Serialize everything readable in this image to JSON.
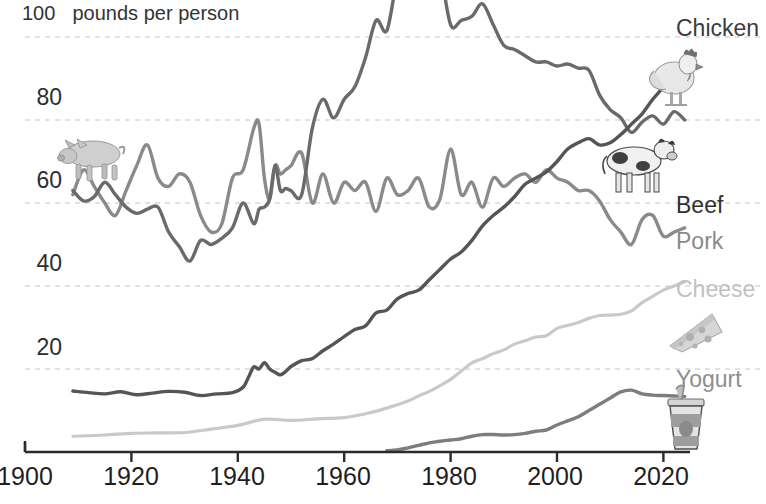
{
  "chart_data": {
    "type": "line",
    "title": "",
    "subtitle": "",
    "xlabel": "",
    "ylabel": "100  pounds per person",
    "axis_note": "100  pounds per person",
    "grid": true,
    "grid_style": "dashed horizontal",
    "legend_position": "right-inline-labels",
    "xlim": [
      1900,
      2025
    ],
    "ylim": [
      0,
      104
    ],
    "xticks": [
      "1900",
      "1920",
      "1940",
      "1960",
      "1980",
      "2000",
      "2020"
    ],
    "xtick_values": [
      1900,
      1920,
      1940,
      1960,
      1980,
      2000,
      2020
    ],
    "yticks": [
      "20",
      "40",
      "60",
      "80",
      "100"
    ],
    "ytick_values": [
      20,
      40,
      60,
      80,
      100
    ],
    "units": "pounds per person",
    "series": [
      {
        "name": "Chicken",
        "label": "Chicken",
        "color": "#555555",
        "emblem": "chicken-illustration",
        "x": [
          1909,
          1912,
          1915,
          1918,
          1921,
          1924,
          1927,
          1930,
          1933,
          1936,
          1939,
          1941,
          1942,
          1943,
          1944,
          1945,
          1946,
          1947,
          1948,
          1949,
          1950,
          1952,
          1954,
          1956,
          1958,
          1960,
          1962,
          1964,
          1966,
          1968,
          1970,
          1972,
          1974,
          1976,
          1978,
          1980,
          1982,
          1984,
          1986,
          1988,
          1990,
          1992,
          1994,
          1996,
          1998,
          2000,
          2002,
          2004,
          2006,
          2008,
          2010,
          2012,
          2014,
          2016,
          2018,
          2020,
          2022,
          2024
        ],
        "y": [
          14.7,
          14.3,
          14.0,
          14.5,
          13.8,
          14.2,
          14.6,
          14.4,
          13.6,
          14.0,
          14.3,
          15.6,
          18.0,
          20.5,
          20.0,
          21.5,
          20.0,
          19.2,
          18.6,
          19.4,
          20.6,
          22.0,
          22.5,
          24.4,
          26.0,
          27.8,
          29.5,
          30.4,
          33.5,
          34.2,
          36.9,
          38.2,
          39.0,
          41.5,
          44.0,
          46.5,
          48.2,
          51.0,
          54.5,
          57.0,
          59.0,
          61.5,
          64.5,
          66.0,
          67.5,
          70.0,
          73.0,
          74.5,
          75.5,
          74.0,
          74.5,
          76.5,
          79.0,
          81.5,
          85.0,
          88.0,
          92.0,
          94.5
        ]
      },
      {
        "name": "Beef",
        "label": "Beef",
        "color": "#6a6a6a",
        "emblem": "cow-illustration",
        "x": [
          1909,
          1911,
          1913,
          1915,
          1917,
          1919,
          1921,
          1923,
          1925,
          1927,
          1929,
          1931,
          1933,
          1935,
          1937,
          1939,
          1941,
          1943,
          1944,
          1945,
          1946,
          1947,
          1948,
          1949,
          1950,
          1952,
          1954,
          1956,
          1958,
          1960,
          1962,
          1964,
          1966,
          1968,
          1970,
          1972,
          1974,
          1976,
          1978,
          1980,
          1982,
          1984,
          1986,
          1988,
          1990,
          1992,
          1994,
          1996,
          1998,
          2000,
          2002,
          2004,
          2006,
          2008,
          2010,
          2012,
          2014,
          2016,
          2018,
          2020,
          2022,
          2024
        ],
        "y": [
          63.0,
          60.5,
          61.5,
          65.0,
          62.0,
          59.0,
          57.5,
          58.5,
          59.0,
          53.0,
          49.5,
          46.0,
          51.0,
          50.0,
          51.5,
          54.0,
          60.0,
          55.0,
          58.5,
          59.0,
          61.0,
          69.0,
          63.0,
          63.5,
          63.0,
          62.0,
          78.0,
          85.0,
          80.5,
          85.0,
          88.0,
          95.0,
          104.0,
          101.5,
          113.7,
          116.0,
          116.8,
          129.0,
          117.0,
          103.0,
          104.0,
          105.0,
          108.0,
          103.0,
          98.0,
          97.0,
          95.5,
          94.0,
          94.0,
          93.0,
          93.5,
          92.5,
          92.0,
          86.0,
          82.5,
          80.5,
          77.0,
          79.5,
          81.0,
          79.0,
          82.0,
          80.0
        ]
      },
      {
        "name": "Pork",
        "label": "Pork",
        "color": "#8a8a8a",
        "emblem": "pig-illustration",
        "x": [
          1909,
          1911,
          1913,
          1915,
          1917,
          1919,
          1921,
          1923,
          1925,
          1927,
          1929,
          1931,
          1933,
          1935,
          1937,
          1939,
          1941,
          1943,
          1944,
          1945,
          1946,
          1947,
          1948,
          1949,
          1950,
          1952,
          1954,
          1956,
          1958,
          1960,
          1962,
          1964,
          1966,
          1968,
          1970,
          1972,
          1974,
          1976,
          1978,
          1980,
          1982,
          1984,
          1986,
          1988,
          1990,
          1992,
          1994,
          1996,
          1998,
          2000,
          2002,
          2004,
          2006,
          2008,
          2010,
          2012,
          2014,
          2016,
          2018,
          2020,
          2022,
          2024
        ],
        "y": [
          62.0,
          68.0,
          64.0,
          60.0,
          57.0,
          63.0,
          69.0,
          74.0,
          66.0,
          64.0,
          67.0,
          65.0,
          57.0,
          53.0,
          55.0,
          66.0,
          68.0,
          78.0,
          79.0,
          66.0,
          61.0,
          69.0,
          67.0,
          68.0,
          69.0,
          72.0,
          60.0,
          67.0,
          60.0,
          65.0,
          63.0,
          65.0,
          58.0,
          66.0,
          62.0,
          63.0,
          66.0,
          59.0,
          61.0,
          73.0,
          62.0,
          65.0,
          59.0,
          66.0,
          64.0,
          66.0,
          67.0,
          65.0,
          68.0,
          66.0,
          65.0,
          63.0,
          63.0,
          60.5,
          56.0,
          53.0,
          50.0,
          56.0,
          57.0,
          52.0,
          53.0,
          54.0
        ]
      },
      {
        "name": "Cheese",
        "label": "Cheese",
        "color": "#c9c9c9",
        "emblem": "cheese-wedge-illustration",
        "x": [
          1909,
          1915,
          1920,
          1925,
          1930,
          1935,
          1940,
          1945,
          1950,
          1955,
          1960,
          1965,
          1970,
          1972,
          1974,
          1976,
          1978,
          1980,
          1982,
          1984,
          1986,
          1988,
          1990,
          1992,
          1994,
          1996,
          1998,
          2000,
          2002,
          2004,
          2006,
          2008,
          2010,
          2012,
          2014,
          2016,
          2018,
          2020,
          2022,
          2024
        ],
        "y": [
          3.8,
          4.1,
          4.5,
          4.6,
          4.7,
          5.5,
          6.4,
          7.9,
          7.6,
          8.0,
          8.3,
          9.5,
          11.4,
          12.3,
          13.5,
          14.6,
          16.0,
          17.5,
          19.5,
          21.5,
          22.5,
          23.7,
          24.6,
          26.0,
          26.8,
          27.7,
          28.0,
          29.8,
          30.5,
          31.2,
          32.2,
          32.9,
          33.0,
          33.2,
          34.0,
          36.0,
          37.5,
          39.0,
          40.0,
          41.0
        ]
      },
      {
        "name": "Yogurt",
        "label": "Yogurt",
        "color": "#7d7d7d",
        "emblem": "yogurt-cup-illustration",
        "x": [
          1968,
          1970,
          1972,
          1974,
          1976,
          1978,
          1980,
          1982,
          1984,
          1986,
          1988,
          1990,
          1992,
          1994,
          1996,
          1998,
          2000,
          2002,
          2004,
          2006,
          2008,
          2010,
          2012,
          2014,
          2016,
          2018,
          2020,
          2022,
          2024
        ],
        "y": [
          0.3,
          0.5,
          1.0,
          1.6,
          2.2,
          2.6,
          2.9,
          3.2,
          3.8,
          4.2,
          4.2,
          4.1,
          4.2,
          4.5,
          5.0,
          5.3,
          6.5,
          7.5,
          8.5,
          10.0,
          11.5,
          13.0,
          14.5,
          14.9,
          14.0,
          13.7,
          13.6,
          13.5,
          13.4
        ]
      }
    ],
    "annotations": [
      {
        "text": "Chicken",
        "series": "Chicken"
      },
      {
        "text": "Beef",
        "series": "Beef"
      },
      {
        "text": "Pork",
        "series": "Pork"
      },
      {
        "text": "Cheese",
        "series": "Cheese"
      },
      {
        "text": "Yogurt",
        "series": "Yogurt"
      }
    ]
  },
  "axes": {
    "unit_note": "100  pounds per person",
    "unit_number": "100",
    "unit_text": "pounds per person",
    "y_tick_labels": [
      "80",
      "60",
      "40",
      "20"
    ],
    "x_tick_labels": [
      "1900",
      "1920",
      "1940",
      "1960",
      "1980",
      "2000",
      "2020"
    ]
  },
  "labels": {
    "chicken": "Chicken",
    "beef": "Beef",
    "pork": "Pork",
    "cheese": "Cheese",
    "yogurt": "Yogurt"
  },
  "colors": {
    "chicken": "#555555",
    "beef": "#6a6a6a",
    "pork": "#8a8a8a",
    "cheese": "#c9c9c9",
    "yogurt": "#7d7d7d",
    "axis": "#2b2b2b",
    "grid": "#c4c4c4",
    "background": "#ffffff"
  }
}
